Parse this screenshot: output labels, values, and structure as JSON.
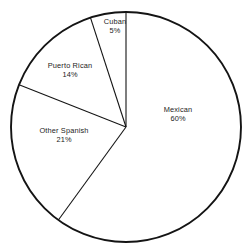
{
  "chart_data": {
    "type": "pie",
    "title": "",
    "subtitle": "",
    "xlabel": "",
    "ylabel": "",
    "legend_position": "none",
    "grid": false,
    "labels_inline": true,
    "start_angle_deg": 0,
    "direction": "clockwise",
    "categories": [
      "Mexican",
      "Puerto Rican",
      "Cuban",
      "Other Spanish"
    ],
    "values": [
      60,
      14,
      5,
      21
    ],
    "value_suffix": "%",
    "slices": [
      {
        "name": "Mexican",
        "value": 60,
        "label": "Mexican",
        "value_label": "60%",
        "start_deg": 0,
        "end_deg": 216,
        "fill": "#ffffff",
        "stroke": "#141414"
      },
      {
        "name": "Other Spanish",
        "value": 21,
        "label": "Other Spanish",
        "value_label": "21%",
        "start_deg": 216,
        "end_deg": 291.6,
        "fill": "#ffffff",
        "stroke": "#141414"
      },
      {
        "name": "Puerto Rican",
        "value": 14,
        "label": "Puerto Rican",
        "value_label": "14%",
        "start_deg": 291.6,
        "end_deg": 342,
        "fill": "#ffffff",
        "stroke": "#141414"
      },
      {
        "name": "Cuban",
        "value": 5,
        "label": "Cuban",
        "value_label": "5%",
        "start_deg": 342,
        "end_deg": 360,
        "fill": "#ffffff",
        "stroke": "#141414"
      }
    ],
    "colors": {
      "background": "#ffffff",
      "outline": "#141414",
      "text": "#1c1c1c"
    }
  }
}
